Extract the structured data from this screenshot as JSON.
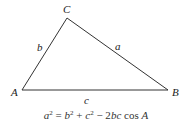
{
  "diagram": {
    "type": "triangle",
    "vertices": {
      "A": {
        "label": "A",
        "x": 22,
        "y": 90
      },
      "B": {
        "label": "B",
        "x": 168,
        "y": 90
      },
      "C": {
        "label": "C",
        "x": 67,
        "y": 18
      }
    },
    "sides": {
      "a": {
        "label": "a",
        "between": "B-C"
      },
      "b": {
        "label": "b",
        "between": "A-C"
      },
      "c": {
        "label": "c",
        "between": "A-B"
      }
    },
    "stroke_color": "#333333"
  },
  "formula": {
    "lhs_var": "a",
    "lhs_exp": "2",
    "eq": " = ",
    "t1_var": "b",
    "t1_exp": "2",
    "plus": " + ",
    "t2_var": "c",
    "t2_exp": "2",
    "minus": " − 2",
    "t3_var": "bc",
    "cos": " cos ",
    "angle": "A"
  }
}
